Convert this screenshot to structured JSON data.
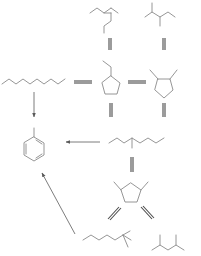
{
  "diagram": {
    "type": "reaction-network",
    "colors": {
      "background": "#ffffff",
      "bond": "#8a8a8a",
      "arrow": "#6e6e6e"
    },
    "molecules": [
      {
        "id": "n-heptane",
        "name": "n-heptane",
        "kind": "linear-alkane"
      },
      {
        "id": "3-ethylpentane",
        "name": "3-ethylpentane",
        "kind": "branched-alkane"
      },
      {
        "id": "2,3-dimethylpentane",
        "name": "2,3-dimethylpentane",
        "kind": "branched-alkane"
      },
      {
        "id": "ethylcyclopentane",
        "name": "ethylcyclopentane",
        "kind": "cycloalkane"
      },
      {
        "id": "1,2-dimethylcyclopentane",
        "name": "1,2-dimethylcyclopentane",
        "kind": "cycloalkane"
      },
      {
        "id": "3-methylhexane",
        "name": "3-methylhexane",
        "kind": "branched-alkane"
      },
      {
        "id": "1,3-dimethylcyclopentane",
        "name": "1,3-dimethylcyclopentane",
        "kind": "cycloalkane"
      },
      {
        "id": "2-methylhexane",
        "name": "2-methylhexane",
        "kind": "branched-alkane"
      },
      {
        "id": "2,4-dimethylpentane",
        "name": "2,4-dimethylpentane",
        "kind": "branched-alkane"
      },
      {
        "id": "toluene",
        "name": "toluene",
        "kind": "aromatic"
      }
    ],
    "reactions": [
      {
        "from": "3-ethylpentane",
        "to": "ethylcyclopentane",
        "type": "equilibrium"
      },
      {
        "from": "2,3-dimethylpentane",
        "to": "1,2-dimethylcyclopentane",
        "type": "equilibrium"
      },
      {
        "from": "n-heptane",
        "to": "ethylcyclopentane",
        "type": "equilibrium"
      },
      {
        "from": "ethylcyclopentane",
        "to": "1,2-dimethylcyclopentane",
        "type": "equilibrium"
      },
      {
        "from": "n-heptane",
        "to": "toluene",
        "type": "irreversible"
      },
      {
        "from": "ethylcyclopentane",
        "to": "3-methylhexane",
        "type": "equilibrium"
      },
      {
        "from": "1,2-dimethylcyclopentane",
        "to": "3-methylhexane",
        "type": "equilibrium"
      },
      {
        "from": "3-methylhexane",
        "to": "toluene",
        "type": "irreversible"
      },
      {
        "from": "3-methylhexane",
        "to": "1,3-dimethylcyclopentane",
        "type": "equilibrium"
      },
      {
        "from": "1,3-dimethylcyclopentane",
        "to": "2-methylhexane",
        "type": "equilibrium"
      },
      {
        "from": "1,3-dimethylcyclopentane",
        "to": "2,4-dimethylpentane",
        "type": "equilibrium"
      },
      {
        "from": "2-methylhexane",
        "to": "toluene",
        "type": "irreversible"
      }
    ]
  }
}
